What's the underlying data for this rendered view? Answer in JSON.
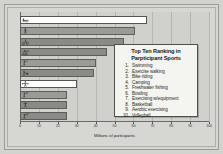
{
  "chart_data": {
    "type": "bar",
    "orientation": "horizontal",
    "title": "",
    "xlabel": "Millions of participants",
    "ylabel": "",
    "xlim": [
      0,
      100
    ],
    "xticks": [
      0,
      10,
      20,
      30,
      40,
      50,
      60,
      70,
      80,
      90,
      100
    ],
    "xtick_labels": [
      "0",
      "10",
      "20",
      "30",
      "40",
      "50",
      "60",
      "70",
      "80",
      "90",
      "100"
    ],
    "grid": true,
    "grid_axis": "x",
    "legend_position": "inside-right",
    "categories": [
      "Swimming",
      "Exercise walking",
      "Bike riding",
      "Camping",
      "Freshwater fishing",
      "Bowling",
      "Exercising w/equipment",
      "Basketball",
      "Aerobic exercising",
      "Volleyball"
    ],
    "values": [
      67,
      61,
      55,
      46,
      40,
      39,
      30,
      25,
      25,
      25
    ],
    "bar_styles": [
      "highlight",
      "gray",
      "dark",
      "dark",
      "gray",
      "dark",
      "highlight",
      "gray",
      "dark",
      "dark"
    ],
    "bar_icons": [
      "swimming-icon",
      "exercise-walking-icon",
      "bike-riding-icon",
      "camping-icon",
      "freshwater-fishing-icon",
      "bowling-icon",
      "exercising-equipment-icon",
      "basketball-icon",
      "aerobic-exercising-icon",
      "volleyball-icon"
    ]
  },
  "legend": {
    "title_line1": "Top Ten Ranking in",
    "title_line2": "Parpticipant Sports",
    "items": [
      {
        "num": "1.",
        "label": "Swimming"
      },
      {
        "num": "2.",
        "label": "Exercise walking"
      },
      {
        "num": "3.",
        "label": "Bike riding"
      },
      {
        "num": "4.",
        "label": "Camping"
      },
      {
        "num": "5.",
        "label": "Freshwater fishing"
      },
      {
        "num": "6.",
        "label": "Bowling"
      },
      {
        "num": "7.",
        "label": "Exercising w/equipment"
      },
      {
        "num": "8.",
        "label": "Basketball"
      },
      {
        "num": "9.",
        "label": "Aerobic exercising"
      },
      {
        "num": "10.",
        "label": "Volleyball"
      }
    ]
  },
  "colors": {
    "page_background": "#d2d2ce",
    "plot_background": "#d0d0cc",
    "bar_gray": "#9a9a96",
    "bar_dark": "#8a8a86",
    "bar_highlight": "#fdfdfb",
    "bar_border": "#5d5d59",
    "gridline": "#b6b6b2",
    "axis": "#6a6a66",
    "legend_background": "#f4f4f0",
    "text": "#2a2a26"
  }
}
